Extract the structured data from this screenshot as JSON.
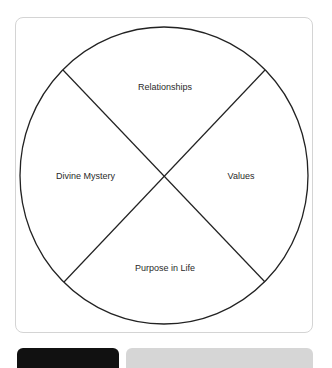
{
  "diagram": {
    "type": "quadrant-circle",
    "quadrants": {
      "top": "Relationships",
      "left": "Divine Mystery",
      "right": "Values",
      "bottom": "Purpose in Life"
    }
  },
  "colors": {
    "line": "#222222",
    "label": "#2a2a2a",
    "card_border": "#d4d4d4",
    "tab_dark": "#111111",
    "tab_light": "#d6d6d6"
  }
}
